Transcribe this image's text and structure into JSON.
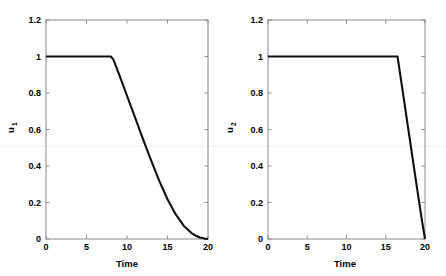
{
  "figure": {
    "background": "#ffffff",
    "line_color": "#101010",
    "axis_color": "#8a8a8a",
    "panels": 2
  },
  "chart_data": [
    {
      "type": "line",
      "title": "",
      "xlabel": "Time",
      "ylabel": "u_1",
      "ylabel_base": "u",
      "ylabel_sub": "1",
      "xlim": [
        0,
        20
      ],
      "ylim": [
        0,
        1.2
      ],
      "xticks": [
        0,
        5,
        10,
        15,
        20
      ],
      "xticklabels": [
        "0",
        "5",
        "10",
        "15",
        "20"
      ],
      "yticks": [
        0,
        0.2,
        0.4,
        0.6,
        0.8,
        1,
        1.2
      ],
      "yticklabels": [
        "0",
        "0.2",
        "0.4",
        "0.6",
        "0.8",
        "1",
        "1.2"
      ],
      "grid": false,
      "legend": null,
      "series": [
        {
          "name": "u1",
          "x": [
            0,
            1,
            2,
            3,
            4,
            5,
            6,
            7,
            8,
            8.3,
            9,
            10,
            11,
            12,
            13,
            14,
            15,
            16,
            17,
            18,
            18.5,
            19,
            19.3,
            19.6,
            19.8,
            20
          ],
          "y": [
            1,
            1,
            1,
            1,
            1,
            1,
            1,
            1,
            1,
            0.985,
            0.905,
            0.785,
            0.665,
            0.545,
            0.428,
            0.317,
            0.218,
            0.136,
            0.073,
            0.031,
            0.018,
            0.008,
            0.005,
            0.002,
            0.001,
            0.0
          ]
        }
      ]
    },
    {
      "type": "line",
      "title": "",
      "xlabel": "Time",
      "ylabel": "u_2",
      "ylabel_base": "u",
      "ylabel_sub": "2",
      "xlim": [
        0,
        20
      ],
      "ylim": [
        0,
        1.2
      ],
      "xticks": [
        0,
        5,
        10,
        15,
        20
      ],
      "xticklabels": [
        "0",
        "5",
        "10",
        "15",
        "20"
      ],
      "yticks": [
        0,
        0.2,
        0.4,
        0.6,
        0.8,
        1,
        1.2
      ],
      "yticklabels": [
        "0",
        "0.2",
        "0.4",
        "0.6",
        "0.8",
        "1",
        "1.2"
      ],
      "grid": false,
      "legend": null,
      "series": [
        {
          "name": "u2",
          "x": [
            0,
            2,
            4,
            6,
            8,
            10,
            12,
            14,
            16,
            16.5,
            17,
            18,
            19,
            19.6,
            20
          ],
          "y": [
            1,
            1,
            1,
            1,
            1,
            1,
            1,
            1,
            1,
            1.0,
            0.855,
            0.565,
            0.275,
            0.105,
            0.0
          ]
        }
      ]
    }
  ]
}
